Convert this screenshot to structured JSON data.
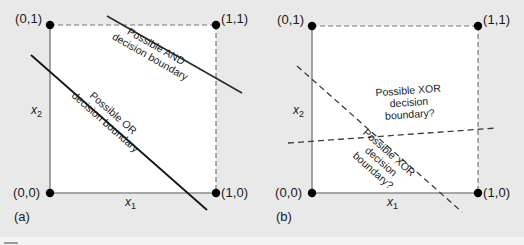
{
  "figure": {
    "type": "diagram",
    "background_color": "#e9e9e9",
    "plot_fill_color": "#ffffff",
    "solid_line_color": "#1a1a1a",
    "dashed_line_color": "#555555",
    "axis_color": "#8c8c8c",
    "point_color": "#000000"
  },
  "panel_a": {
    "label": "(a)",
    "axes": {
      "x": "x",
      "x_sub": "1",
      "y": "x",
      "y_sub": "2"
    },
    "points": [
      {
        "label": "(0,1)",
        "x": 0,
        "y": 1
      },
      {
        "label": "(1,1)",
        "x": 1,
        "y": 1
      },
      {
        "label": "(0,0)",
        "x": 0,
        "y": 0
      },
      {
        "label": "(1,0)",
        "x": 1,
        "y": 0
      }
    ],
    "boundaries": [
      {
        "name": "and-boundary",
        "line1": "Possible AND",
        "line2": "decision boundary",
        "style": "solid"
      },
      {
        "name": "or-boundary",
        "line1": "Possible OR",
        "line2": "decision boundary",
        "style": "solid"
      }
    ]
  },
  "panel_b": {
    "label": "(b)",
    "axes": {
      "x": "x",
      "x_sub": "1",
      "y": "x",
      "y_sub": "2"
    },
    "points": [
      {
        "label": "(0,1)",
        "x": 0,
        "y": 1
      },
      {
        "label": "(1,1)",
        "x": 1,
        "y": 1
      },
      {
        "label": "(0,0)",
        "x": 0,
        "y": 0
      },
      {
        "label": "(1,0)",
        "x": 1,
        "y": 0
      }
    ],
    "boundaries": [
      {
        "name": "xor-boundary-shallow",
        "line1": "Possible XOR",
        "line2": "decision",
        "line3": "boundary?",
        "style": "dashed"
      },
      {
        "name": "xor-boundary-steep",
        "line1": "Possible XOR",
        "line2": "decision",
        "line3": "boundary?",
        "style": "dashed"
      }
    ]
  }
}
